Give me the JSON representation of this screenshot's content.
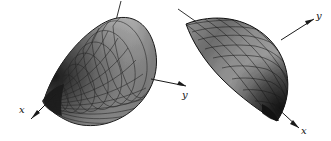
{
  "figure": {
    "type": "two-panel-3d-surface-diagram",
    "background_color": "#ffffff",
    "panels": [
      {
        "name": "left-paraboloid",
        "surface_type": "elliptic-paraboloid",
        "orientation": "apex-lower-left, opening toward upper-right",
        "mesh_style": "radial-and-circumferential-grid",
        "fill_color_light": "#b9b9b9",
        "fill_color_dark": "#4a4a4a",
        "mesh_color": "#2b2b2b",
        "outline_color": "#1a1a1a",
        "axes": [
          {
            "label": "x",
            "direction": "down-left"
          },
          {
            "label": "y",
            "direction": "right"
          },
          {
            "label": "",
            "direction": "up"
          }
        ]
      },
      {
        "name": "right-paraboloid",
        "surface_type": "elliptic-paraboloid",
        "orientation": "apex-lower-right, opening toward upper-left",
        "mesh_style": "diagonal-diamond-grid",
        "fill_color_light": "#a8a8a8",
        "fill_color_dark": "#3a3a3a",
        "mesh_color": "#202020",
        "outline_color": "#111111",
        "axes": [
          {
            "label": "y",
            "direction": "up-right"
          },
          {
            "label": "x",
            "direction": "down-right"
          },
          {
            "label": "",
            "direction": "up-left"
          }
        ]
      }
    ],
    "labels": {
      "left_x": "x",
      "left_y": "y",
      "right_y": "y",
      "right_x": "x"
    }
  }
}
